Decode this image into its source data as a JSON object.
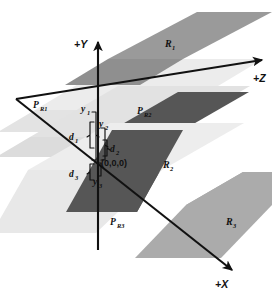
{
  "figure": {
    "background_color": "#ffffff"
  },
  "axes": [
    {
      "id": "y",
      "label": "+Y",
      "direction": "up"
    },
    {
      "id": "z",
      "label": "+Z",
      "direction": "up-right"
    },
    {
      "id": "x",
      "label": "+X",
      "direction": "down-right"
    }
  ],
  "origin": {
    "label": "(0,0,0)"
  },
  "planes": [
    {
      "id": "pr1",
      "label": "P",
      "subscript": "R1",
      "color": "#eeeeee"
    },
    {
      "id": "pr2",
      "label": "P",
      "subscript": "R2",
      "color": "#e4e4e4"
    },
    {
      "id": "pr3",
      "label": "P",
      "subscript": "R3",
      "color": "#ededed"
    }
  ],
  "regions": [
    {
      "id": "r1",
      "label": "R",
      "subscript": "1",
      "color": "#9a9a9a"
    },
    {
      "id": "r2",
      "label": "R",
      "subscript": "2",
      "color": "#575757"
    },
    {
      "id": "r3",
      "label": "R",
      "subscript": "3",
      "color": "#ababab"
    }
  ],
  "dimensions": [
    {
      "id": "y1",
      "label": "y",
      "subscript": "1"
    },
    {
      "id": "y2",
      "label": "y",
      "subscript": "2"
    },
    {
      "id": "y3",
      "label": "y",
      "subscript": "3"
    },
    {
      "id": "d1",
      "label": "d",
      "subscript": "1"
    },
    {
      "id": "d2",
      "label": "d",
      "subscript": "2"
    },
    {
      "id": "d3",
      "label": "d",
      "subscript": "3"
    }
  ],
  "colors": {
    "stroke": "#111111",
    "region_light": "#ababab",
    "region_mid": "#9a9a9a",
    "region_dark": "#575757",
    "plane_tint": "#e9e9e9"
  }
}
